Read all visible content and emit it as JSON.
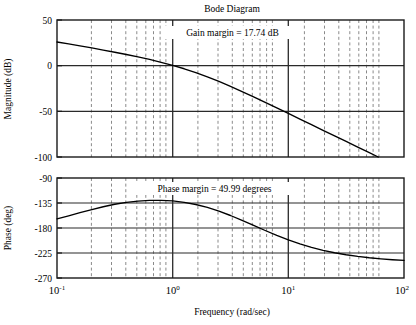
{
  "chart_data": {
    "type": "line",
    "title": "Bode Diagram",
    "xlabel": "Frequency (rad/sec)",
    "xscale": "log",
    "xlim": [
      0.1,
      100
    ],
    "xticks": [
      {
        "value": 0.1,
        "mantissa": "10",
        "exponent": "-1"
      },
      {
        "value": 1,
        "mantissa": "10",
        "exponent": "0"
      },
      {
        "value": 10,
        "mantissa": "10",
        "exponent": "1"
      },
      {
        "value": 100,
        "mantissa": "10",
        "exponent": "2"
      }
    ],
    "grid": true,
    "legend": "none",
    "subplots": [
      {
        "name": "magnitude",
        "ylabel": "Magnitude (dB)",
        "ylim": [
          -100,
          50
        ],
        "yticks": [
          50,
          0,
          -50,
          -100
        ],
        "ytick_labels": [
          "50",
          "0",
          "-50",
          "-100"
        ],
        "annotation": "Gain margin = 17.74 dB",
        "annotation_x": 2.2,
        "annotation_y": 30,
        "series": [
          {
            "name": "open-loop magnitude",
            "x": [
              0.1,
              0.126,
              0.158,
              0.2,
              0.251,
              0.316,
              0.398,
              0.501,
              0.631,
              0.794,
              1.0,
              1.259,
              1.585,
              1.995,
              2.512,
              3.162,
              3.981,
              5.012,
              6.31,
              7.943,
              10.0,
              12.59,
              15.85,
              19.95,
              25.12,
              31.62,
              39.81,
              50.12,
              63.1,
              79.43,
              100.0
            ],
            "y": [
              25.9,
              23.8,
              21.6,
              19.4,
              17.1,
              14.7,
              12.2,
              9.6,
              6.8,
              3.7,
              0.3,
              -3.4,
              -7.6,
              -12.2,
              -17.2,
              -22.6,
              -28.3,
              -34.1,
              -40.1,
              -46.2,
              -52.3,
              -58.5,
              -64.6,
              -70.8,
              -76.9,
              -83.0,
              -89.2,
              -95.3,
              -101.4,
              -107.5,
              -113.6
            ]
          }
        ]
      },
      {
        "name": "phase",
        "ylabel": "Phase (deg)",
        "ylim": [
          -270,
          -90
        ],
        "yticks": [
          -90,
          -135,
          -180,
          -225,
          -270
        ],
        "ytick_labels": [
          "-90",
          "-135",
          "-180",
          "-225",
          "-270"
        ],
        "annotation": "Phase margin = 49.99 degrees",
        "annotation_x": 1.55,
        "annotation_y": -103,
        "series": [
          {
            "name": "open-loop phase",
            "x": [
              0.1,
              0.126,
              0.158,
              0.2,
              0.251,
              0.316,
              0.398,
              0.501,
              0.631,
              0.794,
              1.0,
              1.259,
              1.585,
              1.995,
              2.512,
              3.162,
              3.981,
              5.012,
              6.31,
              7.943,
              10.0,
              12.59,
              15.85,
              19.95,
              25.12,
              31.62,
              39.81,
              50.12,
              63.1,
              79.43,
              100.0
            ],
            "y": [
              -163.5,
              -158.0,
              -152.3,
              -146.8,
              -141.7,
              -137.3,
              -133.9,
              -131.5,
              -130.3,
              -130.2,
              -131.3,
              -133.8,
              -137.7,
              -143.0,
              -149.7,
              -157.5,
              -166.2,
              -175.3,
              -184.5,
              -193.3,
              -201.4,
              -208.6,
              -214.9,
              -220.2,
              -224.6,
              -228.2,
              -231.2,
              -233.6,
              -235.5,
              -237.1,
              -238.4
            ]
          }
        ]
      }
    ],
    "markers": {
      "gain_margin_db": 17.74,
      "phase_margin_deg": 49.99,
      "gain_crossover_rad_per_sec": 1.0,
      "phase_crossover_rad_per_sec": 10.0
    }
  }
}
